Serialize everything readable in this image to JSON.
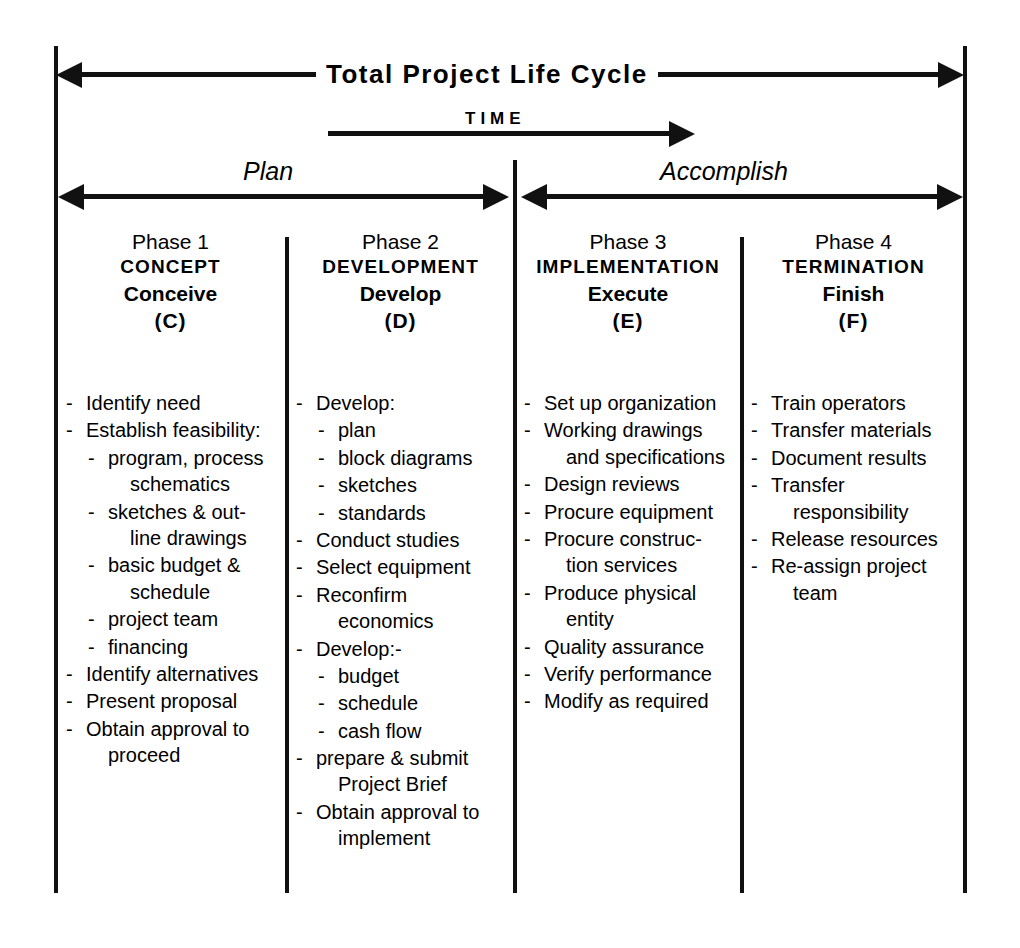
{
  "diagram": {
    "title": "Total Project Life Cycle",
    "time_axis_label": "TIME",
    "bands": [
      {
        "label": "Plan"
      },
      {
        "label": "Accomplish"
      }
    ]
  },
  "phases": [
    {
      "number": "Phase 1",
      "name": "CONCEPT",
      "verb": "Conceive",
      "code": "(C)",
      "tasks": [
        {
          "level": 0,
          "bullet": "-",
          "lines": [
            "Identify need"
          ]
        },
        {
          "level": 0,
          "bullet": "-",
          "lines": [
            "Establish feasibility:"
          ]
        },
        {
          "level": 1,
          "bullet": "-",
          "lines": [
            "program, process",
            "schematics"
          ]
        },
        {
          "level": 1,
          "bullet": "-",
          "lines": [
            "sketches & out-",
            "line drawings"
          ]
        },
        {
          "level": 1,
          "bullet": "-",
          "lines": [
            "basic budget &",
            "schedule"
          ]
        },
        {
          "level": 1,
          "bullet": "-",
          "lines": [
            "project team"
          ]
        },
        {
          "level": 1,
          "bullet": "-",
          "lines": [
            "financing"
          ]
        },
        {
          "level": 0,
          "bullet": "-",
          "lines": [
            "Identify alternatives"
          ]
        },
        {
          "level": 0,
          "bullet": "-",
          "lines": [
            "Present proposal"
          ]
        },
        {
          "level": 0,
          "bullet": "-",
          "lines": [
            "Obtain approval to",
            "proceed"
          ]
        }
      ]
    },
    {
      "number": "Phase 2",
      "name": "DEVELOPMENT",
      "verb": "Develop",
      "code": "(D)",
      "tasks": [
        {
          "level": 0,
          "bullet": "-",
          "lines": [
            "Develop:"
          ]
        },
        {
          "level": 1,
          "bullet": "-",
          "lines": [
            "plan"
          ]
        },
        {
          "level": 1,
          "bullet": "-",
          "lines": [
            "block diagrams"
          ]
        },
        {
          "level": 1,
          "bullet": "-",
          "lines": [
            "sketches"
          ]
        },
        {
          "level": 1,
          "bullet": "-",
          "lines": [
            "standards"
          ]
        },
        {
          "level": 0,
          "bullet": "-",
          "lines": [
            "Conduct studies"
          ]
        },
        {
          "level": 0,
          "bullet": "-",
          "lines": [
            "Select equipment"
          ]
        },
        {
          "level": 0,
          "bullet": "-",
          "lines": [
            "Reconfirm",
            "economics"
          ]
        },
        {
          "level": 0,
          "bullet": "-",
          "lines": [
            "Develop:-"
          ]
        },
        {
          "level": 1,
          "bullet": "-",
          "lines": [
            "budget"
          ]
        },
        {
          "level": 1,
          "bullet": "-",
          "lines": [
            "schedule"
          ]
        },
        {
          "level": 1,
          "bullet": "-",
          "lines": [
            "cash flow"
          ]
        },
        {
          "level": 0,
          "bullet": "-",
          "lines": [
            "prepare & submit",
            "Project Brief"
          ]
        },
        {
          "level": 0,
          "bullet": "-",
          "lines": [
            "Obtain approval to",
            "implement"
          ]
        }
      ]
    },
    {
      "number": "Phase 3",
      "name": "IMPLEMENTATION",
      "verb": "Execute",
      "code": "(E)",
      "tasks": [
        {
          "level": 0,
          "bullet": "-",
          "lines": [
            "Set up organization"
          ]
        },
        {
          "level": 0,
          "bullet": "-",
          "lines": [
            "Working drawings",
            "and specifications"
          ]
        },
        {
          "level": 0,
          "bullet": "-",
          "lines": [
            "Design reviews"
          ]
        },
        {
          "level": 0,
          "bullet": "-",
          "lines": [
            "Procure equipment"
          ]
        },
        {
          "level": 0,
          "bullet": "-",
          "lines": [
            "Procure construc-",
            "tion services"
          ]
        },
        {
          "level": 0,
          "bullet": "-",
          "lines": [
            "Produce physical",
            "entity"
          ]
        },
        {
          "level": 0,
          "bullet": "-",
          "lines": [
            "Quality assurance"
          ]
        },
        {
          "level": 0,
          "bullet": "-",
          "lines": [
            "Verify performance"
          ]
        },
        {
          "level": 0,
          "bullet": "-",
          "lines": [
            "Modify as required"
          ]
        }
      ]
    },
    {
      "number": "Phase 4",
      "name": "TERMINATION",
      "verb": "Finish",
      "code": "(F)",
      "tasks": [
        {
          "level": 0,
          "bullet": "-",
          "lines": [
            "Train operators"
          ]
        },
        {
          "level": 0,
          "bullet": "-",
          "lines": [
            "Transfer materials"
          ]
        },
        {
          "level": 0,
          "bullet": "-",
          "lines": [
            "Document results"
          ]
        },
        {
          "level": 0,
          "bullet": "-",
          "lines": [
            "Transfer",
            "responsibility"
          ]
        },
        {
          "level": 0,
          "bullet": "-",
          "lines": [
            "Release resources"
          ]
        },
        {
          "level": 0,
          "bullet": "-",
          "lines": [
            "Re-assign project",
            "team"
          ]
        }
      ]
    }
  ],
  "colors": {
    "ink": "#111111",
    "paper": "#ffffff"
  }
}
